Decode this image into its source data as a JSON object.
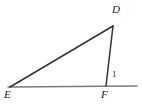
{
  "figure": {
    "type": "triangle-with-extended-base",
    "background_color": "#ffffff",
    "stroke_color": "#333333",
    "baseline_color": "#7a7a7a",
    "label_color": "#1a1a1a"
  },
  "points": {
    "D": {
      "label": "D",
      "x": 113,
      "y": 26
    },
    "E": {
      "label": "E",
      "x": 10,
      "y": 87
    },
    "F": {
      "label": "F",
      "x": 106,
      "y": 86
    }
  },
  "baseline": {
    "x1": 8,
    "y1": 87,
    "x2": 137,
    "y2": 86
  },
  "segments": [
    {
      "name": "segment-ED",
      "from": "E",
      "to": "D"
    },
    {
      "name": "segment-DF",
      "from": "D",
      "to": "F"
    }
  ],
  "angles": [
    {
      "name": "angle-1",
      "label": "1",
      "at": "F",
      "x": 114,
      "y": 74
    }
  ]
}
